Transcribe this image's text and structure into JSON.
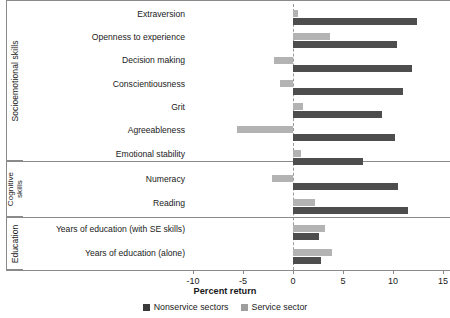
{
  "chart_data": {
    "type": "bar",
    "orientation": "horizontal",
    "title": "",
    "xlabel": "Percent return",
    "ylabel": "",
    "xlim": [
      -10,
      15
    ],
    "xticks": [
      -10,
      -5,
      0,
      5,
      10,
      15
    ],
    "xticklabels": [
      "-10",
      "-5",
      "0",
      "5",
      "10",
      "15"
    ],
    "grid": false,
    "zero_line": true,
    "legend_position": "bottom",
    "groups": [
      {
        "name": "Socioemotional skills",
        "categories": [
          "Extraversion",
          "Openness to experience",
          "Decision making",
          "Conscientiousness",
          "Grit",
          "Agreeableness",
          "Emotional stability"
        ]
      },
      {
        "name": "Cognitive skills",
        "categories": [
          "Numeracy",
          "Reading"
        ]
      },
      {
        "name": "Education",
        "categories": [
          "Years of education (with SE skills)",
          "Years of education (alone)"
        ]
      }
    ],
    "categories": [
      "Extraversion",
      "Openness to experience",
      "Decision making",
      "Conscientiousness",
      "Grit",
      "Agreeableness",
      "Emotional stability",
      "Numeracy",
      "Reading",
      "Years of education (with SE skills)",
      "Years of education (alone)"
    ],
    "series": [
      {
        "name": "Nonservice sectors",
        "color": "#4d4d4d",
        "values": [
          12.4,
          10.4,
          11.9,
          11.0,
          8.9,
          10.2,
          7.0,
          10.5,
          11.5,
          2.6,
          2.8
        ]
      },
      {
        "name": "Service sector",
        "color": "#b3b3b3",
        "values": [
          0.5,
          3.7,
          -1.9,
          -1.3,
          1.0,
          -5.6,
          0.8,
          -2.1,
          2.2,
          3.2,
          3.9
        ]
      }
    ]
  },
  "legend": {
    "items": [
      {
        "label": "Nonservice sectors",
        "color": "#3a3a3a"
      },
      {
        "label": "Service sector",
        "color": "#9e9e9e"
      }
    ]
  }
}
